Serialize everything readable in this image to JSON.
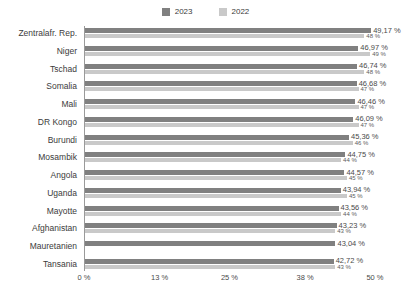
{
  "legend": {
    "items": [
      {
        "label": "2023",
        "color": "#808080",
        "icon": "square-swatch-icon"
      },
      {
        "label": "2022",
        "color": "#c9c9c9",
        "icon": "square-swatch-icon"
      }
    ]
  },
  "axis": {
    "ticks": [
      "0 %",
      "13 %",
      "25 %",
      "38 %",
      "50 %"
    ]
  },
  "chart_data": {
    "type": "bar",
    "orientation": "horizontal",
    "title": "",
    "subtitle": "",
    "xlabel": "",
    "ylabel": "",
    "xlim": [
      0,
      50
    ],
    "grid": false,
    "legend_position": "top-center",
    "tick_values": [
      0,
      13,
      25,
      38,
      50
    ],
    "tick_labels": [
      "0 %",
      "13 %",
      "25 %",
      "38 %",
      "50 %"
    ],
    "categories": [
      "Zentralafr. Rep.",
      "Niger",
      "Tschad",
      "Somalia",
      "Mali",
      "DR Kongo",
      "Burundi",
      "Mosambik",
      "Angola",
      "Uganda",
      "Mayotte",
      "Afghanistan",
      "Mauretanien",
      "Tansania"
    ],
    "series": [
      {
        "name": "2023",
        "color": "#808080",
        "values": [
          49.17,
          46.97,
          46.74,
          46.68,
          46.46,
          46.09,
          45.36,
          44.75,
          44.57,
          43.94,
          43.56,
          43.23,
          43.04,
          42.72
        ],
        "labels": [
          "49,17 %",
          "46,97 %",
          "46,74 %",
          "46,68 %",
          "46,46 %",
          "46,09 %",
          "45,36 %",
          "44,75 %",
          "44,57 %",
          "43,94 %",
          "43,56 %",
          "43,23 %",
          "43,04 %",
          "42,72 %"
        ]
      },
      {
        "name": "2022",
        "color": "#c9c9c9",
        "values": [
          48,
          49,
          48,
          47,
          47,
          47,
          46,
          44,
          45,
          45,
          44,
          43,
          null,
          43
        ],
        "labels": [
          "48 %",
          "49 %",
          "48 %",
          "47 %",
          "47 %",
          "47 %",
          "46 %",
          "44 %",
          "45 %",
          "45 %",
          "44 %",
          "43 %",
          "",
          "43 %"
        ]
      }
    ]
  }
}
